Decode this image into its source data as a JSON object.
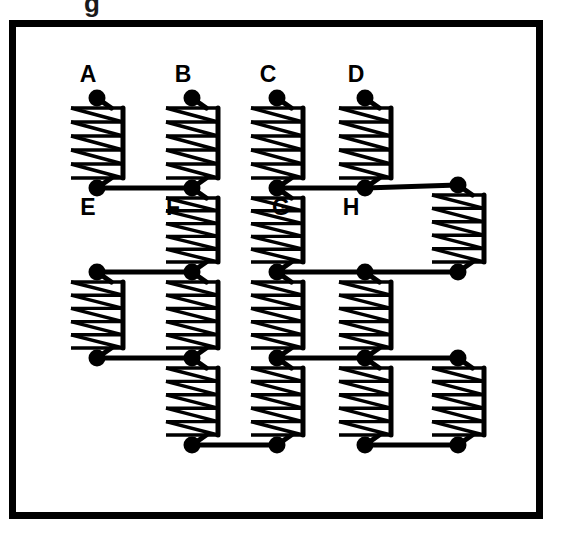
{
  "figure": {
    "title_fragment": "g",
    "colors": {
      "ink": "#000000",
      "background": "#ffffff",
      "frame": "#000000"
    },
    "frame": {
      "x": 9,
      "y": 20,
      "width": 534,
      "height": 499,
      "stroke_width": 7
    },
    "geometry": {
      "node_radius": 8.5,
      "spring_body_stroke": 3.4,
      "connector_stroke": 5.0,
      "spring_coils": 5,
      "spring_rails": 6,
      "spring_inset": 10,
      "spring_half_width": 26
    },
    "labels": [
      {
        "text": "A",
        "x": 88,
        "y": 82,
        "node": "A"
      },
      {
        "text": "B",
        "x": 183,
        "y": 82,
        "node": "B"
      },
      {
        "text": "C",
        "x": 268,
        "y": 82,
        "node": "C"
      },
      {
        "text": "D",
        "x": 356,
        "y": 82,
        "node": "D"
      },
      {
        "text": "E",
        "x": 88,
        "y": 215,
        "node": "E"
      },
      {
        "text": "F",
        "x": 173,
        "y": 215,
        "node": "F"
      },
      {
        "text": "G",
        "x": 281,
        "y": 215,
        "node": "G"
      },
      {
        "text": "H",
        "x": 351,
        "y": 215,
        "node": "H"
      }
    ],
    "nodes": [
      {
        "id": "A",
        "x": 97,
        "y": 98,
        "label": "A"
      },
      {
        "id": "B",
        "x": 192,
        "y": 98,
        "label": "B"
      },
      {
        "id": "C",
        "x": 277,
        "y": 98,
        "label": "C"
      },
      {
        "id": "D",
        "x": 365,
        "y": 98,
        "label": "D"
      },
      {
        "id": "E",
        "x": 97,
        "y": 188,
        "label": "E"
      },
      {
        "id": "F",
        "x": 192,
        "y": 188,
        "label": "F"
      },
      {
        "id": "G",
        "x": 277,
        "y": 188,
        "label": "G"
      },
      {
        "id": "H",
        "x": 365,
        "y": 188,
        "label": "H"
      },
      {
        "id": "I",
        "x": 458,
        "y": 185,
        "label": ""
      },
      {
        "id": "J",
        "x": 97,
        "y": 272,
        "label": ""
      },
      {
        "id": "K",
        "x": 192,
        "y": 272,
        "label": ""
      },
      {
        "id": "L",
        "x": 277,
        "y": 272,
        "label": ""
      },
      {
        "id": "M",
        "x": 365,
        "y": 272,
        "label": ""
      },
      {
        "id": "N",
        "x": 458,
        "y": 272,
        "label": ""
      },
      {
        "id": "O",
        "x": 97,
        "y": 358,
        "label": ""
      },
      {
        "id": "P",
        "x": 192,
        "y": 358,
        "label": ""
      },
      {
        "id": "Q",
        "x": 277,
        "y": 358,
        "label": ""
      },
      {
        "id": "R",
        "x": 365,
        "y": 358,
        "label": ""
      },
      {
        "id": "S",
        "x": 458,
        "y": 358,
        "label": ""
      },
      {
        "id": "T",
        "x": 192,
        "y": 445,
        "label": ""
      },
      {
        "id": "U",
        "x": 277,
        "y": 445,
        "label": ""
      },
      {
        "id": "V",
        "x": 365,
        "y": 445,
        "label": ""
      },
      {
        "id": "W",
        "x": 458,
        "y": 445,
        "label": ""
      }
    ],
    "springs": [
      {
        "from": "A",
        "to": "E",
        "orientation": "vertical"
      },
      {
        "from": "B",
        "to": "F",
        "orientation": "vertical"
      },
      {
        "from": "C",
        "to": "G",
        "orientation": "vertical"
      },
      {
        "from": "D",
        "to": "H",
        "orientation": "vertical"
      },
      {
        "from": "F",
        "to": "K",
        "orientation": "vertical"
      },
      {
        "from": "G",
        "to": "L",
        "orientation": "vertical"
      },
      {
        "from": "I",
        "to": "N",
        "orientation": "vertical"
      },
      {
        "from": "J",
        "to": "O",
        "orientation": "vertical"
      },
      {
        "from": "K",
        "to": "P",
        "orientation": "vertical"
      },
      {
        "from": "L",
        "to": "Q",
        "orientation": "vertical"
      },
      {
        "from": "M",
        "to": "R",
        "orientation": "vertical"
      },
      {
        "from": "P",
        "to": "T",
        "orientation": "vertical"
      },
      {
        "from": "Q",
        "to": "U",
        "orientation": "vertical"
      },
      {
        "from": "R",
        "to": "V",
        "orientation": "vertical"
      },
      {
        "from": "S",
        "to": "W",
        "orientation": "vertical"
      }
    ],
    "connectors": [
      {
        "from": "E",
        "to": "F"
      },
      {
        "from": "G",
        "to": "H"
      },
      {
        "from": "H",
        "to": "I"
      },
      {
        "from": "J",
        "to": "K"
      },
      {
        "from": "L",
        "to": "M"
      },
      {
        "from": "M",
        "to": "N"
      },
      {
        "from": "O",
        "to": "P"
      },
      {
        "from": "Q",
        "to": "R"
      },
      {
        "from": "R",
        "to": "S"
      },
      {
        "from": "T",
        "to": "U"
      },
      {
        "from": "V",
        "to": "W"
      }
    ]
  }
}
